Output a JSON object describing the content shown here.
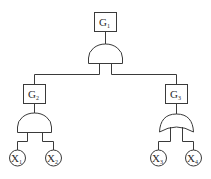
{
  "diagram": {
    "type": "fault-tree",
    "colors": {
      "stroke": "#3a3a3a",
      "text": "#2a2a2a",
      "background": "#ffffff"
    },
    "top_event": {
      "id": "G1",
      "base": "G",
      "sub": "1",
      "gate": "AND"
    },
    "intermediate_events": [
      {
        "id": "G2",
        "base": "G",
        "sub": "2",
        "gate": "AND",
        "inputs": [
          "X1",
          "X2"
        ]
      },
      {
        "id": "G3",
        "base": "G",
        "sub": "3",
        "gate": "OR",
        "inputs": [
          "X3",
          "X4"
        ]
      }
    ],
    "basic_events": [
      {
        "id": "X1",
        "base": "X",
        "sub": "1"
      },
      {
        "id": "X2",
        "base": "X",
        "sub": "2"
      },
      {
        "id": "X3",
        "base": "X",
        "sub": "3"
      },
      {
        "id": "X4",
        "base": "X",
        "sub": "4"
      }
    ]
  }
}
